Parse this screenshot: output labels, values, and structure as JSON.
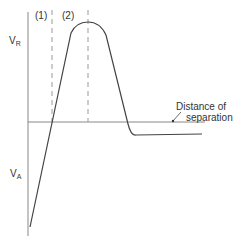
{
  "diagram": {
    "type": "potential-energy-curve",
    "labels": {
      "region1": "(1)",
      "region2": "(2)",
      "vr_main": "V",
      "vr_sub": "R",
      "va_main": "V",
      "va_sub": "A",
      "axis_line1": "Distance of",
      "axis_line2": "separation"
    },
    "colors": {
      "line": "#444444",
      "axis": "#888888",
      "dashed": "#999999",
      "text": "#333333"
    }
  }
}
